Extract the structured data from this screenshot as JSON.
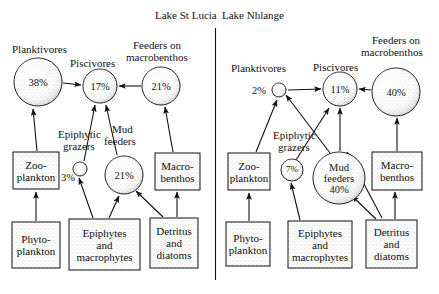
{
  "figure": {
    "type": "food-web-diagram",
    "panels": [
      {
        "id": "lake-st-lucia",
        "title": "Lake St Lucia",
        "nodes": [
          {
            "id": "planktivores",
            "label": "Planktivores",
            "value": "38%",
            "shape": "circle",
            "cx": 38,
            "cy": 82,
            "r": 24
          },
          {
            "id": "piscivores",
            "label": "Piscivores",
            "value": "17%",
            "shape": "circle",
            "cx": 100,
            "cy": 86,
            "r": 17
          },
          {
            "id": "feeders-on-macrobenthos",
            "label": "Feeders on macrobenthos",
            "value": "21%",
            "shape": "circle",
            "cx": 161,
            "cy": 86,
            "r": 19
          },
          {
            "id": "epiphytic-grazers",
            "label": "Epiphytic grazers",
            "value": "3%",
            "shape": "circle",
            "cx": 80,
            "cy": 169,
            "r": 7
          },
          {
            "id": "mud-feeders",
            "label": "Mud feeders",
            "value": "21%",
            "shape": "circle",
            "cx": 124,
            "cy": 175,
            "r": 19
          },
          {
            "id": "zooplankton",
            "label": "Zoo-plankton",
            "shape": "box",
            "x": 13,
            "y": 152,
            "w": 46,
            "h": 37
          },
          {
            "id": "macrobenthos",
            "label": "Macro-benthos",
            "shape": "box",
            "x": 155,
            "y": 153,
            "w": 45,
            "h": 37
          },
          {
            "id": "phytoplankton",
            "label": "Phyto-plankton",
            "shape": "box",
            "x": 12,
            "y": 222,
            "w": 48,
            "h": 46
          },
          {
            "id": "epiphytes-macrophytes",
            "label": "Epiphytes and macrophytes",
            "shape": "box",
            "x": 69,
            "y": 219,
            "w": 71,
            "h": 51
          },
          {
            "id": "detritus-diatoms",
            "label": "Detritus and diatoms",
            "shape": "box",
            "x": 150,
            "y": 218,
            "w": 48,
            "h": 50
          }
        ]
      },
      {
        "id": "lake-nhlange",
        "title": "Lake Nhlange",
        "nodes": [
          {
            "id": "planktivores",
            "label": "Planktivores",
            "value": "2%",
            "shape": "circle",
            "cx": 279,
            "cy": 90,
            "r": 7
          },
          {
            "id": "piscivores",
            "label": "Piscivores",
            "value": "11%",
            "shape": "circle",
            "cx": 340,
            "cy": 89,
            "r": 17
          },
          {
            "id": "feeders-on-macrobenthos",
            "label": "Feeders on macrobenthos",
            "value": "40%",
            "shape": "circle",
            "cx": 396,
            "cy": 92,
            "r": 24
          },
          {
            "id": "epiphytic-grazers",
            "label": "Epiphytic grazers",
            "value": "7%",
            "shape": "circle",
            "cx": 292,
            "cy": 170,
            "r": 11
          },
          {
            "id": "mud-feeders",
            "label": "Mud feeders",
            "value": "40%",
            "shape": "circle",
            "cx": 339,
            "cy": 178,
            "r": 26
          },
          {
            "id": "zooplankton",
            "label": "Zoo-plankton",
            "shape": "box",
            "x": 228,
            "y": 153,
            "w": 42,
            "h": 37
          },
          {
            "id": "macrobenthos",
            "label": "Macro-benthos",
            "shape": "box",
            "x": 372,
            "y": 152,
            "w": 50,
            "h": 38
          },
          {
            "id": "phytoplankton",
            "label": "Phyto-plankton",
            "shape": "box",
            "x": 226,
            "y": 222,
            "w": 44,
            "h": 44
          },
          {
            "id": "epiphytes-macrophytes",
            "label": "Epiphytes and macrophytes",
            "shape": "box",
            "x": 288,
            "y": 221,
            "w": 64,
            "h": 47
          },
          {
            "id": "detritus-diatoms",
            "label": "Detritus and diatoms",
            "shape": "box",
            "x": 366,
            "y": 220,
            "w": 51,
            "h": 48
          }
        ]
      }
    ],
    "labels": {
      "planktivores": "Planktivores",
      "piscivores": "Piscivores",
      "feeders_on_line1": "Feeders on",
      "feeders_on_line2": "macrobenthos",
      "epiphytic_line1": "Epiphytic",
      "epiphytic_line2": "grazers",
      "mud_line1": "Mud",
      "mud_line2": "feeders",
      "mud_feeders_inline1": "Mud",
      "mud_feeders_inline2": "feeders",
      "zoo_line1": "Zoo-",
      "zoo_line2": "plankton",
      "phyto_line1": "Phyto-",
      "phyto_line2": "plankton",
      "macro_line1": "Macro-",
      "macro_line2": "benthos",
      "epimac_line1": "Epiphytes",
      "epimac_line2": "and",
      "epimac_line3": "macrophytes",
      "detritus_line1": "Detritus",
      "detritus_line2": "and",
      "detritus_line3": "diatoms"
    },
    "values": {
      "left_planktivores": "38%",
      "left_piscivores": "17%",
      "left_feeders": "21%",
      "left_grazers": "3%",
      "left_mudfeeders": "21%",
      "right_planktivores": "2%",
      "right_piscivores": "11%",
      "right_feeders": "40%",
      "right_grazers": "7%",
      "right_mudfeeders": "40%"
    },
    "colors": {
      "ink": "#111111",
      "fill": "#e8e6e0",
      "background": "#ffffff"
    }
  }
}
